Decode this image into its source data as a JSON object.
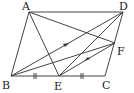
{
  "diagram": {
    "points": {
      "A": {
        "label": "A",
        "x": 29,
        "y": 12
      },
      "B": {
        "label": "B",
        "x": 11,
        "y": 76
      },
      "C": {
        "label": "C",
        "x": 105,
        "y": 76
      },
      "D": {
        "label": "D",
        "x": 123,
        "y": 12
      },
      "E": {
        "label": "E",
        "x": 59,
        "y": 76
      },
      "F": {
        "label": "F",
        "x": 115,
        "y": 43
      }
    },
    "segments": [
      "AD",
      "AB",
      "BC",
      "CD",
      "AE",
      "AF",
      "BD",
      "BF",
      "ED",
      "EF"
    ],
    "arrow_segments": [
      "BD",
      "EF"
    ],
    "equal_marks": [
      "BE",
      "EC"
    ],
    "stroke_color": "#444444"
  }
}
